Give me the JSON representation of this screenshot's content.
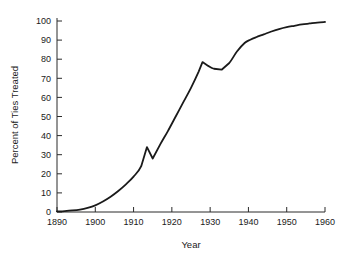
{
  "chart_data": {
    "type": "line",
    "title": "",
    "xlabel": "Year",
    "ylabel": "Percent of Ties Treated",
    "xlim": [
      1890,
      1960
    ],
    "ylim": [
      0,
      100
    ],
    "grid": false,
    "legend": null,
    "xticks": [
      1890,
      1900,
      1910,
      1920,
      1930,
      1940,
      1950,
      1960
    ],
    "xtick_labels": [
      "1890",
      "1900",
      "1910",
      "1920",
      "1930",
      "1940",
      "1950",
      "1960"
    ],
    "yticks": [
      0,
      10,
      20,
      30,
      40,
      50,
      60,
      70,
      80,
      90,
      100
    ],
    "ytick_labels": [
      "0",
      "10",
      "20",
      "30",
      "40",
      "50",
      "60",
      "70",
      "80",
      "90",
      "100"
    ],
    "series": [
      {
        "name": "Percent of Ties Treated",
        "color": "#1a1a1a",
        "x": [
          1890,
          1892,
          1894,
          1896,
          1898,
          1900,
          1902,
          1904,
          1906,
          1908,
          1910,
          1912,
          1913.5,
          1915,
          1917,
          1919,
          1921,
          1923,
          1925,
          1927,
          1928,
          1929.5,
          1931,
          1933,
          1935,
          1937,
          1939,
          1940.5,
          1942,
          1944,
          1946,
          1948,
          1950,
          1952,
          1954,
          1956,
          1958,
          1960
        ],
        "values": [
          0.3,
          0.5,
          0.8,
          1.3,
          2.2,
          3.5,
          5.5,
          8.0,
          11.0,
          14.5,
          18.5,
          24.0,
          34.0,
          28.0,
          35.5,
          42.5,
          50.0,
          57.5,
          65.0,
          73.5,
          78.5,
          76.5,
          75.0,
          74.5,
          78.0,
          84.0,
          88.5,
          90.2,
          91.5,
          93.0,
          94.5,
          95.8,
          96.8,
          97.5,
          98.2,
          98.7,
          99.2,
          99.5
        ]
      }
    ],
    "annotations": [
      {
        "label": "pre-war peak",
        "x": 1913.5,
        "y": 34.0
      },
      {
        "label": "wartime drop",
        "x": 1915,
        "y": 28.0
      },
      {
        "label": "late-1920s peak",
        "x": 1928,
        "y": 78.5
      },
      {
        "label": "depression trough",
        "x": 1933,
        "y": 74.5
      }
    ]
  },
  "axes": {
    "x_title": "Year",
    "y_title": "Percent of Ties Treated"
  }
}
